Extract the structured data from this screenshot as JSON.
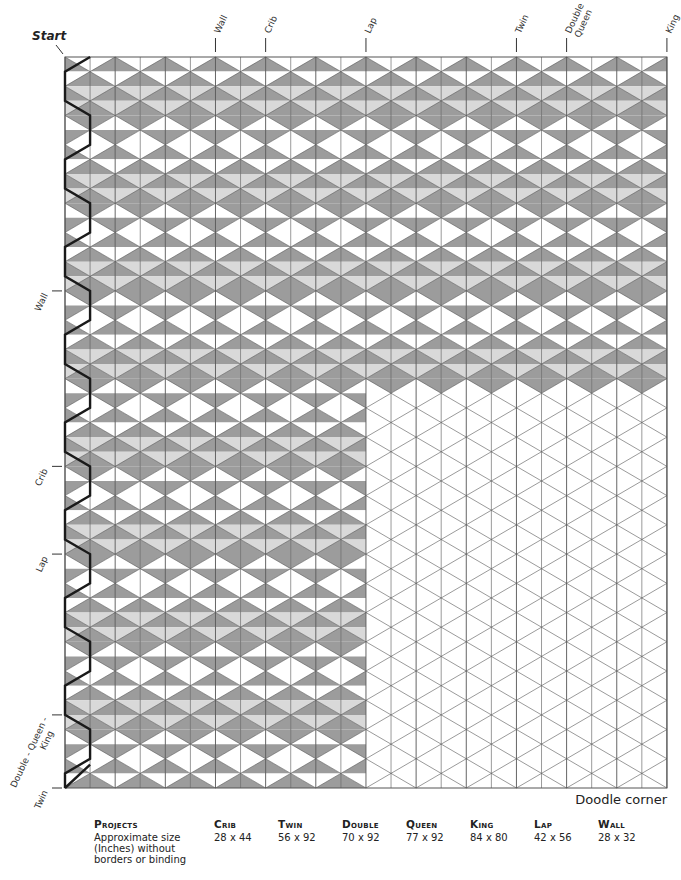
{
  "diagram": {
    "start_label": "Start",
    "doodle_corner_label": "Doodle corner",
    "top_markers": [
      {
        "label": "Wall",
        "col": 6
      },
      {
        "label": "Crib",
        "col": 8
      },
      {
        "label": "Lap",
        "col": 12
      },
      {
        "label": "Twin",
        "col": 18
      },
      {
        "label": "Double\nQueen",
        "col": 20
      },
      {
        "label": "King",
        "col": 24
      }
    ],
    "left_markers": [
      {
        "label": "Wall",
        "row": 16
      },
      {
        "label": "Crib",
        "row": 28
      },
      {
        "label": "Lap",
        "row": 34
      },
      {
        "label": "Double - Queen -\nKing",
        "row": 45
      },
      {
        "label": "Twin",
        "row": 50
      }
    ],
    "grid": {
      "half_columns": 24,
      "rows": 50,
      "full_shaded_rows": 23,
      "partial_shaded_half_columns": 12
    },
    "colors": {
      "dark": "#9c9c9c",
      "light": "#d9d9d9",
      "white": "#ffffff",
      "line": "#555555",
      "path": "#1a1a1a"
    }
  },
  "projects_table": {
    "header_label": "Projects",
    "row_label": "Approximate size (Inches) without borders or binding",
    "columns": [
      {
        "name": "Crib",
        "size": "28 x 44"
      },
      {
        "name": "Twin",
        "size": "56 x 92"
      },
      {
        "name": "Double",
        "size": "70 x 92"
      },
      {
        "name": "Queen",
        "size": "77 x 92"
      },
      {
        "name": "King",
        "size": "84 x 80"
      },
      {
        "name": "Lap",
        "size": "42 x 56"
      },
      {
        "name": "Wall",
        "size": "28 x 32"
      }
    ]
  }
}
